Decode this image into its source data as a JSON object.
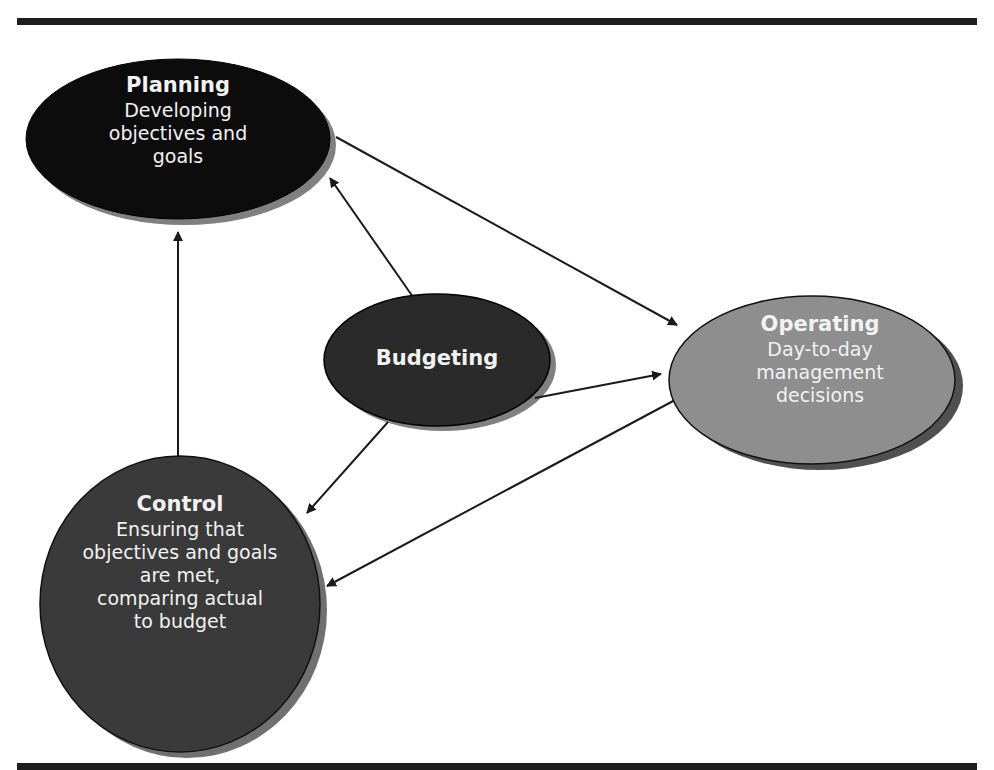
{
  "nodes": {
    "planning": {
      "title": "Planning",
      "lines": [
        "Developing",
        "objectives and",
        "goals"
      ],
      "fill": "#0c0c0c"
    },
    "budgeting": {
      "title": "Budgeting",
      "lines": [],
      "fill": "#2a2a2a"
    },
    "operating": {
      "title": "Operating",
      "lines": [
        "Day-to-day",
        "management",
        "decisions"
      ],
      "fill": "#8e8e8e"
    },
    "control": {
      "title": "Control",
      "lines": [
        "Ensuring that",
        "objectives and goals",
        "are met,",
        "comparing actual",
        "to budget"
      ],
      "fill": "#3a3a3a"
    }
  },
  "edges": [
    {
      "from": "Budgeting",
      "to": "Planning"
    },
    {
      "from": "Budgeting",
      "to": "Operating"
    },
    {
      "from": "Budgeting",
      "to": "Control"
    },
    {
      "from": "Planning",
      "to": "Operating"
    },
    {
      "from": "Operating",
      "to": "Control"
    },
    {
      "from": "Control",
      "to": "Planning"
    }
  ],
  "colors": {
    "rule": "#1e1e1e",
    "shadow": "#808080",
    "arrow": "#1a1a1a",
    "text": "#f2f2f2"
  }
}
